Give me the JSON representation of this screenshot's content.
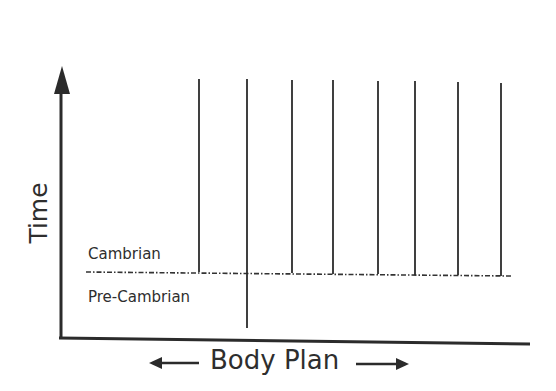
{
  "diagram": {
    "y_axis_label": "Time",
    "x_axis_label": "Body Plan",
    "boundary_upper_label": "Cambrian",
    "boundary_lower_label": "Pre-Cambrian",
    "colors": {
      "line": "#2b2b2b",
      "text": "#2e2e2e",
      "background": "#ffffff"
    }
  },
  "lineages": [
    {
      "x": 199,
      "top": 79,
      "bottom": 272,
      "crosses_boundary": false
    },
    {
      "x": 247,
      "top": 79,
      "bottom": 328,
      "crosses_boundary": true
    },
    {
      "x": 292,
      "top": 80,
      "bottom": 273,
      "crosses_boundary": false
    },
    {
      "x": 333,
      "top": 80,
      "bottom": 274,
      "crosses_boundary": false
    },
    {
      "x": 378,
      "top": 81,
      "bottom": 274,
      "crosses_boundary": false
    },
    {
      "x": 415,
      "top": 81,
      "bottom": 275,
      "crosses_boundary": false
    },
    {
      "x": 458,
      "top": 82,
      "bottom": 275,
      "crosses_boundary": false
    },
    {
      "x": 501,
      "top": 83,
      "bottom": 276,
      "crosses_boundary": false
    }
  ]
}
